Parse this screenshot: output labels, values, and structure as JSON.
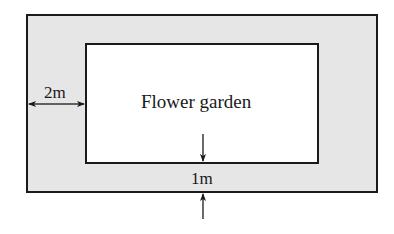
{
  "diagram": {
    "type": "area-diagram",
    "colors": {
      "path_fill": "#e6e6e6",
      "garden_fill": "#ffffff",
      "stroke": "#1a1a1a"
    },
    "outer_rect": {
      "x": 27,
      "y": 15,
      "width": 350,
      "height": 177
    },
    "inner_rect": {
      "x": 86,
      "y": 44,
      "width": 232,
      "height": 119
    },
    "garden_label": "Flower garden",
    "side_width_label": "2m",
    "bottom_width_label": "1m"
  }
}
